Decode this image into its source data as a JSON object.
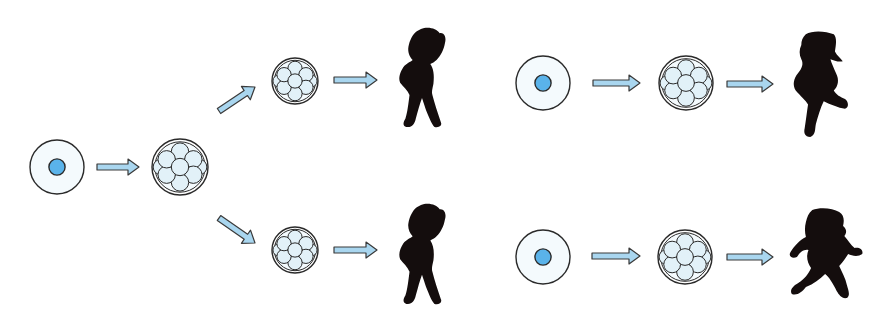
{
  "title": "Identical vs. fraternal twin development",
  "colors": {
    "background": "#ffffff",
    "cell_fill": "#f4fafd",
    "nucleus_fill": "#5ab3ea",
    "blastomere_fill": "#e2f1f8",
    "outline": "#2a2a2a",
    "arrow_fill": "#a9d6ef",
    "arrow_stroke": "#3a3a3a",
    "silhouette": "#140d0d"
  },
  "panels": [
    {
      "name": "identical-twins",
      "description": "One zygote divides into an embryo that splits into two embryos, producing two identical boys",
      "elements": [
        {
          "type": "zygote",
          "cx": 57,
          "cy": 167,
          "r": 27
        },
        {
          "type": "arrow",
          "x1": 97,
          "y1": 167,
          "x2": 139,
          "y2": 167
        },
        {
          "type": "morula",
          "cx": 180,
          "cy": 167,
          "r": 28
        },
        {
          "type": "arrow",
          "x1": 219,
          "y1": 111,
          "x2": 255,
          "y2": 87
        },
        {
          "type": "arrow",
          "x1": 219,
          "y1": 218,
          "x2": 255,
          "y2": 243
        },
        {
          "type": "morula",
          "cx": 295,
          "cy": 81,
          "r": 23
        },
        {
          "type": "morula",
          "cx": 295,
          "cy": 250,
          "r": 23
        },
        {
          "type": "arrow",
          "x1": 334,
          "y1": 80,
          "x2": 377,
          "y2": 80
        },
        {
          "type": "arrow",
          "x1": 334,
          "y1": 250,
          "x2": 377,
          "y2": 250
        },
        {
          "type": "boy-standing",
          "x": 396,
          "y": 26,
          "w": 52,
          "h": 103
        },
        {
          "type": "boy-standing",
          "x": 396,
          "y": 202,
          "w": 52,
          "h": 104
        }
      ]
    },
    {
      "name": "fraternal-twins",
      "description": "Two separate zygotes each develop into an embryo, producing two different girls",
      "elements": [
        {
          "type": "zygote",
          "cx": 543,
          "cy": 83,
          "r": 27
        },
        {
          "type": "arrow",
          "x1": 593,
          "y1": 83,
          "x2": 640,
          "y2": 83
        },
        {
          "type": "morula",
          "cx": 686,
          "cy": 83,
          "r": 27
        },
        {
          "type": "arrow",
          "x1": 727,
          "y1": 84,
          "x2": 773,
          "y2": 84
        },
        {
          "type": "girl-running",
          "x": 789,
          "y": 30,
          "w": 56,
          "h": 108
        },
        {
          "type": "zygote",
          "cx": 543,
          "cy": 257,
          "r": 27
        },
        {
          "type": "arrow",
          "x1": 592,
          "y1": 256,
          "x2": 640,
          "y2": 256
        },
        {
          "type": "morula",
          "cx": 685,
          "cy": 257,
          "r": 27
        },
        {
          "type": "arrow",
          "x1": 727,
          "y1": 257,
          "x2": 773,
          "y2": 257
        },
        {
          "type": "girl-running-2",
          "x": 788,
          "y": 207,
          "w": 64,
          "h": 100
        }
      ]
    }
  ]
}
